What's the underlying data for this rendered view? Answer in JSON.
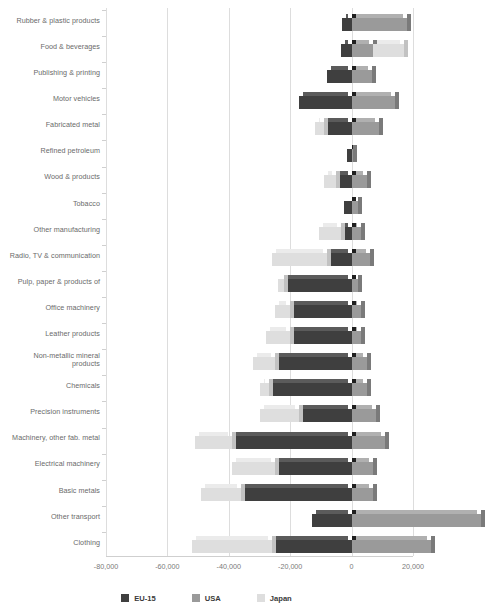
{
  "chart_data": {
    "type": "bar",
    "orientation": "horizontal",
    "stacked": true,
    "title": "",
    "xlabel": "",
    "ylabel": "",
    "xlim": [
      -80000,
      20000
    ],
    "grid": true,
    "legend_position": "bottom",
    "xticks": [
      "-80,000",
      "-60,000",
      "-40,000",
      "-20,000",
      "0",
      "20,000"
    ],
    "xtick_values": [
      -80000,
      -60000,
      -40000,
      -20000,
      0,
      20000
    ],
    "categories": [
      "Rubber & plastic products",
      "Food & beverages",
      "Publishing & printing",
      "Motor vehicles",
      "Fabricated metal",
      "Refined petroleum",
      "Wood & products",
      "Tobacco",
      "Other manufacturing",
      "Radio, TV & communication",
      "Pulp, paper & products of",
      "Office machinery",
      "Leather products",
      "Non-metallic mineral\nproducts",
      "Chemicals",
      "Precision instruments",
      "Machinery, other fab. metal",
      "Electrical machinery",
      "Basic metals",
      "Other transport",
      "Clothing"
    ],
    "series": [
      {
        "name": "EU-15",
        "color": "#3f3f3f",
        "values": [
          -3000,
          -3500,
          -8000,
          -17000,
          -9000,
          -1500,
          -5000,
          -2500,
          -3500,
          -8000,
          -22000,
          -20000,
          -20000,
          -25000,
          -27000,
          -17000,
          -39000,
          -25000,
          -36000,
          -13000,
          -26000
        ]
      },
      {
        "name": "USA",
        "color": "#9a9a9a",
        "values": [
          18000,
          7000,
          6500,
          14000,
          9000,
          500,
          5000,
          2000,
          3000,
          6000,
          2000,
          3000,
          3000,
          5000,
          5000,
          8000,
          11000,
          7000,
          7000,
          42000,
          26000
        ]
      },
      {
        "name": "Japan",
        "color": "#dedede",
        "values": [
          0,
          10000,
          0,
          0,
          -3000,
          0,
          -4000,
          0,
          -7000,
          -18000,
          -2000,
          -5000,
          -8000,
          -7000,
          -3000,
          -13000,
          -12000,
          -14000,
          -13000,
          0,
          -26000
        ]
      }
    ]
  },
  "legend": {
    "items": [
      {
        "label": "EU-15",
        "color": "#3f3f3f"
      },
      {
        "label": "USA",
        "color": "#9a9a9a"
      },
      {
        "label": "Japan",
        "color": "#dedede"
      }
    ]
  }
}
